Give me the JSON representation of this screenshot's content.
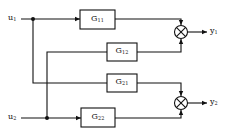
{
  "diagram": {
    "type": "block-diagram",
    "title": "",
    "inputs": [
      {
        "id": "u1",
        "label": "u",
        "sub": "1"
      },
      {
        "id": "u2",
        "label": "u",
        "sub": "2"
      }
    ],
    "outputs": [
      {
        "id": "y1",
        "label": "y",
        "sub": "1"
      },
      {
        "id": "y2",
        "label": "y",
        "sub": "2"
      }
    ],
    "blocks": [
      {
        "id": "G11",
        "label": "G",
        "sub": "11"
      },
      {
        "id": "G12",
        "label": "G",
        "sub": "12"
      },
      {
        "id": "G21",
        "label": "G",
        "sub": "21"
      },
      {
        "id": "G22",
        "label": "G",
        "sub": "22"
      }
    ],
    "summing_junctions": [
      {
        "id": "S1",
        "symbol": "⊗",
        "inputs": [
          "G11",
          "G12"
        ],
        "output": "y1"
      },
      {
        "id": "S2",
        "symbol": "⊗",
        "inputs": [
          "G21",
          "G22"
        ],
        "output": "y2"
      }
    ],
    "connections": [
      {
        "from": "u1",
        "to": "G11"
      },
      {
        "from": "u1",
        "to": "G21"
      },
      {
        "from": "u2",
        "to": "G12"
      },
      {
        "from": "u2",
        "to": "G22"
      },
      {
        "from": "G11",
        "to": "S1"
      },
      {
        "from": "G12",
        "to": "S1"
      },
      {
        "from": "G21",
        "to": "S2"
      },
      {
        "from": "G22",
        "to": "S2"
      },
      {
        "from": "S1",
        "to": "y1"
      },
      {
        "from": "S2",
        "to": "y2"
      }
    ],
    "colors": {
      "line": "#111111",
      "background": "#ffffff"
    }
  }
}
